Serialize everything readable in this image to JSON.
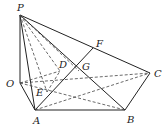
{
  "diagram": {
    "type": "solid-geometry",
    "stroke_color": "#222222",
    "points": {
      "P": {
        "label": "P",
        "x": 20,
        "y": 15
      },
      "O": {
        "label": "O",
        "x": 20,
        "y": 83
      },
      "A": {
        "label": "A",
        "x": 35,
        "y": 110
      },
      "B": {
        "label": "B",
        "x": 125,
        "y": 110
      },
      "C": {
        "label": "C",
        "x": 150,
        "y": 73
      },
      "D": {
        "label": "D",
        "x": 60,
        "y": 71
      },
      "E": {
        "label": "E",
        "x": 47,
        "y": 92
      },
      "F": {
        "label": "F",
        "x": 93,
        "y": 48
      },
      "G": {
        "label": "G",
        "x": 79,
        "y": 71
      }
    },
    "solid_edges": [
      "PO",
      "PA",
      "PB",
      "PC",
      "OA",
      "AB",
      "BC",
      "AF"
    ],
    "dashed_edges": [
      "OC",
      "OB",
      "PD",
      "PE",
      "PG",
      "AC",
      "DG",
      "EG"
    ]
  }
}
